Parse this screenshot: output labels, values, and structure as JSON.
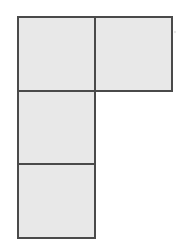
{
  "figure": {
    "name": "L-shaped polyomino of four unit squares",
    "shape_label": "L-tetromino",
    "cell_count": 4,
    "grid": {
      "columns": 2,
      "rows": 3,
      "origin_x": 18,
      "origin_y": 17,
      "cell_width": 77,
      "cell_height": 73.5
    },
    "colors": {
      "background": "#ffffff",
      "cell_fill": "#e8e8e8",
      "cell_stroke": "#4a4a4a",
      "speck": "#b0b0b0"
    },
    "stroke_width": 2,
    "cells": [
      {
        "id": "cell-r1c1",
        "row": 1,
        "col": 1,
        "x": 18,
        "y": 17,
        "w": 77,
        "h": 73.5
      },
      {
        "id": "cell-r1c2",
        "row": 1,
        "col": 2,
        "x": 95,
        "y": 17,
        "w": 77,
        "h": 73.5
      },
      {
        "id": "cell-r2c1",
        "row": 2,
        "col": 1,
        "x": 18,
        "y": 90.5,
        "w": 77,
        "h": 73.5
      },
      {
        "id": "cell-r3c1",
        "row": 3,
        "col": 1,
        "x": 18,
        "y": 164,
        "w": 77,
        "h": 73.5
      }
    ],
    "specks": [
      {
        "id": "speck-right",
        "cx": 175,
        "cy": 32,
        "r": 1.2
      }
    ]
  },
  "chart_data": {
    "type": "diagram",
    "title": "",
    "shape": "L-tetromino",
    "grid_columns": 2,
    "grid_rows": 3,
    "occupied_cells": [
      [
        1,
        1
      ],
      [
        1,
        2
      ],
      [
        2,
        1
      ],
      [
        3,
        1
      ]
    ],
    "empty_cells": [
      [
        2,
        2
      ],
      [
        3,
        2
      ]
    ],
    "total_squares": 4
  }
}
